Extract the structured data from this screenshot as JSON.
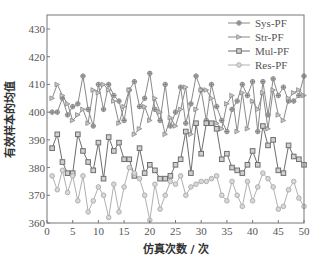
{
  "chart_data": {
    "type": "line",
    "title": "",
    "xlabel": "仿真次数 / 次",
    "ylabel": "有效样本的均值",
    "xlim": [
      0,
      50
    ],
    "ylim": [
      360,
      435
    ],
    "xticks": [
      0,
      5,
      10,
      15,
      20,
      25,
      30,
      35,
      40,
      45,
      50
    ],
    "yticks": [
      360,
      370,
      380,
      390,
      400,
      410,
      420,
      430
    ],
    "grid": false,
    "legend_position": "upper right",
    "x": [
      1,
      2,
      3,
      4,
      5,
      6,
      7,
      8,
      9,
      10,
      11,
      12,
      13,
      14,
      15,
      16,
      17,
      18,
      19,
      20,
      21,
      22,
      23,
      24,
      25,
      26,
      27,
      28,
      29,
      30,
      31,
      32,
      33,
      34,
      35,
      36,
      37,
      38,
      39,
      40,
      41,
      42,
      43,
      44,
      45,
      46,
      47,
      48,
      49,
      50
    ],
    "series": [
      {
        "name": "Sys-PF",
        "marker": "asterisk-circle",
        "color": "#8a8a8a",
        "values": [
          400,
          400,
          405,
          399,
          402,
          403,
          413,
          401,
          395,
          410,
          401,
          410,
          406,
          404,
          397,
          408,
          411,
          402,
          405,
          414,
          401,
          397,
          410,
          395,
          400,
          409,
          396,
          403,
          413,
          408,
          397,
          410,
          402,
          397,
          393,
          401,
          404,
          410,
          406,
          411,
          393,
          411,
          399,
          412,
          406,
          409,
          404,
          404,
          406,
          413
        ]
      },
      {
        "name": "Str-PF",
        "marker": "triangle-right",
        "color": "#8a8a8a",
        "values": [
          405,
          410,
          406,
          403,
          397,
          399,
          401,
          396,
          408,
          407,
          410,
          408,
          404,
          396,
          402,
          408,
          392,
          394,
          402,
          397,
          405,
          400,
          392,
          398,
          395,
          401,
          409,
          392,
          401,
          408,
          408,
          405,
          396,
          394,
          403,
          406,
          393,
          407,
          394,
          404,
          401,
          407,
          394,
          408,
          399,
          397,
          405,
          407,
          408,
          406
        ]
      },
      {
        "name": "Mul-PF",
        "marker": "square",
        "color": "#6e6e6e",
        "values": [
          387,
          392,
          382,
          378,
          378,
          392,
          386,
          382,
          379,
          389,
          376,
          391,
          386,
          389,
          383,
          383,
          377,
          387,
          378,
          381,
          379,
          376,
          376,
          377,
          381,
          383,
          393,
          378,
          396,
          385,
          396,
          396,
          394,
          383,
          385,
          380,
          379,
          378,
          381,
          386,
          381,
          395,
          388,
          390,
          379,
          378,
          388,
          384,
          383,
          381
        ]
      },
      {
        "name": "Res-PF",
        "marker": "circle",
        "color": "#b0b0b0",
        "values": [
          377,
          372,
          379,
          371,
          377,
          368,
          377,
          364,
          368,
          373,
          370,
          362,
          374,
          364,
          373,
          380,
          378,
          376,
          370,
          361,
          374,
          365,
          370,
          375,
          374,
          377,
          370,
          373,
          374,
          375,
          375,
          376,
          377,
          370,
          368,
          375,
          370,
          366,
          375,
          368,
          373,
          378,
          376,
          373,
          365,
          366,
          372,
          375,
          369,
          366
        ]
      }
    ]
  },
  "legend": {
    "items": [
      {
        "label": "Sys-PF"
      },
      {
        "label": "Str-PF"
      },
      {
        "label": "Mul-PF"
      },
      {
        "label": "Res-PF"
      }
    ]
  },
  "axes": {
    "xlabel": "仿真次数 / 次",
    "ylabel": "有效样本的均值"
  }
}
